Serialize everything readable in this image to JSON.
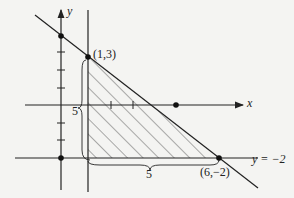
{
  "labels": {
    "y_axis": "y",
    "x_axis": "x",
    "point_top": "(1,3)",
    "point_bottom": "(6,−2)",
    "line_label": "y = −2",
    "height_label": "5",
    "width_label": "5"
  },
  "colors": {
    "ink": "#222222",
    "background": "#f4f4f2"
  }
}
